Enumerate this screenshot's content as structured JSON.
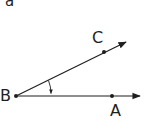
{
  "figure": {
    "subfigure_label": "a",
    "points": {
      "B": {
        "label": "B",
        "x": 16,
        "y": 96,
        "role": "vertex"
      },
      "A": {
        "label": "A",
        "x": 112,
        "y": 96
      },
      "C": {
        "label": "C",
        "x": 104,
        "y": 52
      }
    },
    "rays": [
      {
        "name": "ray-BA",
        "from": "B",
        "through": "A",
        "tip": [
          141,
          96
        ]
      },
      {
        "name": "ray-BC",
        "from": "B",
        "through": "C",
        "tip": [
          126,
          42
        ]
      }
    ],
    "angle_marker": {
      "vertex": "B",
      "from_ray": "BC",
      "to_ray": "BA",
      "direction": "clockwise"
    },
    "stroke_color": "#1f1f1f"
  }
}
